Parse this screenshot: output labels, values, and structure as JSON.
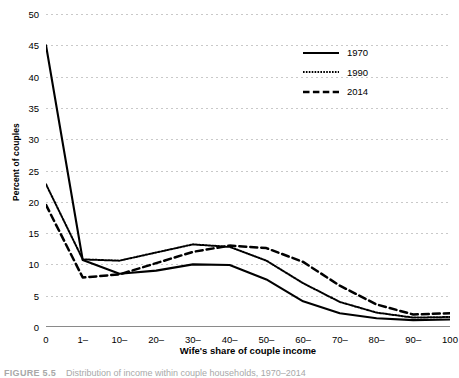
{
  "chart_data": {
    "type": "line",
    "title": "",
    "xlabel": "Wife's share of couple income",
    "ylabel": "Percent of couples",
    "categories": [
      "0",
      "1–",
      "10–",
      "20–",
      "30–",
      "40–",
      "50–",
      "60–",
      "70–",
      "80–",
      "90–",
      "100"
    ],
    "ylim": [
      0,
      50
    ],
    "ytick_step": 5,
    "yticks": [
      0,
      5,
      10,
      15,
      20,
      25,
      30,
      35,
      40,
      45,
      50
    ],
    "grid": true,
    "legend_position": "top-right",
    "series": [
      {
        "name": "1970",
        "style": "solid",
        "color": "#000000",
        "values": [
          45.0,
          10.7,
          8.5,
          9.0,
          10.0,
          9.9,
          7.6,
          4.1,
          2.2,
          1.4,
          1.1,
          1.2
        ]
      },
      {
        "name": "1990",
        "style": "dotted",
        "color": "#000000",
        "values": [
          22.8,
          10.8,
          10.6,
          11.9,
          13.2,
          12.8,
          10.6,
          7.0,
          4.0,
          2.3,
          1.5,
          1.6
        ]
      },
      {
        "name": "2014",
        "style": "dashed",
        "color": "#000000",
        "values": [
          19.5,
          7.9,
          8.4,
          10.2,
          12.0,
          13.0,
          12.6,
          10.4,
          6.6,
          3.6,
          2.0,
          2.2
        ]
      }
    ]
  },
  "legend": {
    "entries": [
      {
        "label": "1970"
      },
      {
        "label": "1990"
      },
      {
        "label": "2014"
      }
    ]
  },
  "caption": {
    "figure_number": "FIGURE 5.5",
    "text": "Distribution of income within couple households, 1970–2014"
  }
}
